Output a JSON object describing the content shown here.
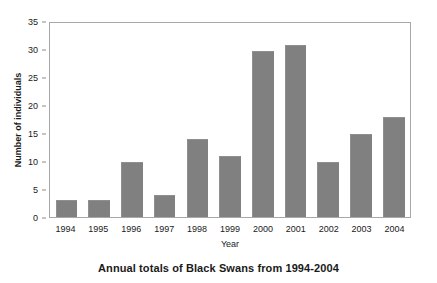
{
  "chart_data": {
    "type": "bar",
    "title": "",
    "caption": "Annual totals of Black Swans from 1994-2004",
    "categories": [
      "1994",
      "1995",
      "1996",
      "1997",
      "1998",
      "1999",
      "2000",
      "2001",
      "2002",
      "2003",
      "2004"
    ],
    "values": [
      3,
      3,
      10,
      4,
      14,
      11,
      30,
      31,
      10,
      15,
      18
    ],
    "xlabel": "Year",
    "ylabel": "Number of individuals",
    "ylim": [
      0,
      35
    ],
    "yticks": [
      0,
      5,
      10,
      15,
      20,
      25,
      30,
      35
    ],
    "ytick_labels": [
      "0",
      "5",
      "10",
      "15",
      "20",
      "25",
      "30",
      "35"
    ],
    "grid": false,
    "legend": false,
    "bar_color": "#808080",
    "plot_background": "#ffffff",
    "axis_color": "#a8a8a8"
  }
}
